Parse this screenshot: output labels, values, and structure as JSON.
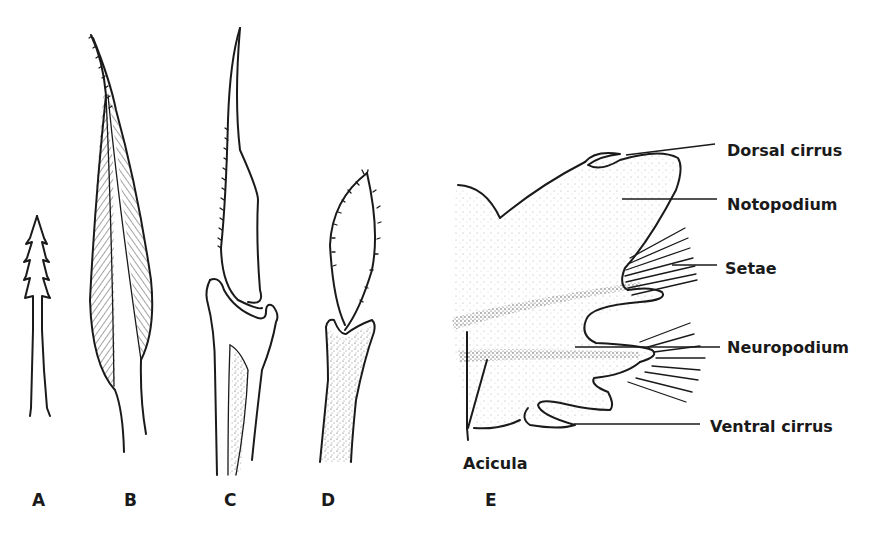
{
  "figure": {
    "panels": [
      {
        "id": "A",
        "label": "A",
        "description": "serrated seta"
      },
      {
        "id": "B",
        "label": "B",
        "description": "hatched bladed seta"
      },
      {
        "id": "C",
        "label": "C",
        "description": "compound falciger seta"
      },
      {
        "id": "D",
        "label": "D",
        "description": "spinous blade compound seta"
      },
      {
        "id": "E",
        "label": "E",
        "description": "parapodium"
      }
    ],
    "parapodium_labels": {
      "dorsal_cirrus": "Dorsal cirrus",
      "notopodium": "Notopodium",
      "setae": "Setae",
      "neuropodium": "Neuropodium",
      "ventral_cirrus": "Ventral cirrus",
      "acicula": "Acicula"
    },
    "colors": {
      "ink": "#1a1a1a",
      "background": "#ffffff",
      "stipple": "#8a8a8a"
    }
  }
}
